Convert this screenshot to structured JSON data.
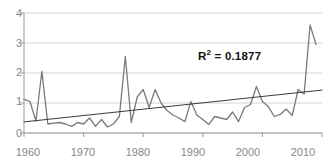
{
  "chart_data": {
    "type": "line",
    "title": "",
    "xlabel": "",
    "ylabel": "",
    "xlim": [
      1960,
      2010
    ],
    "ylim": [
      0,
      4
    ],
    "xticks": [
      "1960",
      "1970",
      "1980",
      "1990",
      "2000",
      "2010"
    ],
    "yticks": [
      "0",
      "1",
      "2",
      "3",
      "4"
    ],
    "grid": "horizontal",
    "legend": "none",
    "annotations": [
      {
        "text": "R² = 0.1877",
        "r_label": "R",
        "exponent": "2",
        "equals_value": " = 0.1877"
      }
    ],
    "series": [
      {
        "name": "data",
        "color": "#7a7a7a",
        "x": [
          1960,
          1961,
          1962,
          1963,
          1964,
          1965,
          1966,
          1967,
          1968,
          1969,
          1970,
          1971,
          1972,
          1973,
          1974,
          1975,
          1976,
          1977,
          1978,
          1979,
          1980,
          1981,
          1982,
          1983,
          1984,
          1985,
          1986,
          1987,
          1988,
          1989,
          1990,
          1991,
          1992,
          1993,
          1994,
          1995,
          1996,
          1997,
          1998,
          1999,
          2000,
          2001,
          2002,
          2003,
          2004,
          2005,
          2006,
          2007,
          2008,
          2009
        ],
        "values": [
          1.12,
          1.05,
          0.4,
          2.05,
          0.3,
          0.33,
          0.35,
          0.3,
          0.22,
          0.35,
          0.3,
          0.5,
          0.22,
          0.45,
          0.2,
          0.3,
          0.55,
          2.55,
          0.35,
          1.2,
          1.45,
          0.85,
          1.45,
          1.0,
          0.75,
          0.6,
          0.5,
          0.38,
          1.05,
          0.6,
          0.45,
          0.28,
          0.55,
          0.5,
          0.45,
          0.7,
          0.38,
          0.85,
          0.95,
          1.55,
          1.05,
          0.88,
          0.55,
          0.62,
          0.8,
          0.58,
          1.45,
          1.3,
          3.6,
          2.95
        ]
      },
      {
        "name": "trendline",
        "color": "#3a3a3a",
        "x": [
          1960,
          2010
        ],
        "values": [
          0.37,
          1.43
        ]
      }
    ]
  }
}
